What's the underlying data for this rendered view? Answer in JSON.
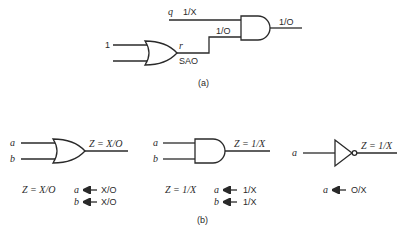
{
  "figure_a": {
    "caption": "(a)",
    "input_one_label": "1",
    "q_label": "q",
    "q_value": "1/X",
    "r_label": "r",
    "r_fault": "SAO",
    "r_value": "1/O",
    "output_value": "1/O"
  },
  "figure_b": {
    "caption": "(b)",
    "or_example": {
      "input_a": "a",
      "input_b": "b",
      "output": "Z = X/O",
      "result_z": "Z = X/O",
      "assign_a_var": "a",
      "assign_a_val": "X/O",
      "assign_b_var": "b",
      "assign_b_val": "X/O"
    },
    "and_example": {
      "input_a": "a",
      "input_b": "b",
      "output": "Z = 1/X",
      "result_z": "Z = 1/X",
      "assign_a_var": "a",
      "assign_a_val": "1/X",
      "assign_b_var": "b",
      "assign_b_val": "1/X"
    },
    "not_example": {
      "input_a": "a",
      "output": "Z = 1/X",
      "assign_a_var": "a",
      "assign_a_val": "O/X"
    }
  }
}
